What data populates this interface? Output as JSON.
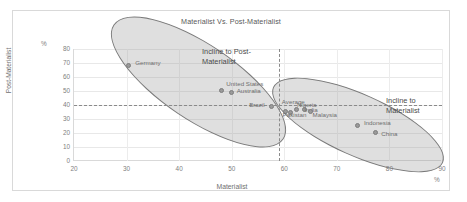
{
  "chart_data": {
    "type": "scatter",
    "title": "Materialist Vs. Post-Materialist",
    "xlabel": "Materialist",
    "ylabel": "Post-Materialist",
    "x_unit": "%",
    "y_unit": "%",
    "xlim": [
      20,
      90
    ],
    "ylim": [
      0,
      80
    ],
    "xticks": [
      20,
      30,
      40,
      50,
      60,
      70,
      80,
      90
    ],
    "yticks": [
      0,
      10,
      20,
      30,
      40,
      50,
      60,
      70,
      80
    ],
    "grid": true,
    "legend": "none",
    "points": [
      {
        "label": "Germany",
        "x": 30.3,
        "y": 68
      },
      {
        "label": "United States",
        "x": 48.0,
        "y": 50.5
      },
      {
        "label": "Australia",
        "x": 50.0,
        "y": 49
      },
      {
        "label": "Brazil",
        "x": 57.5,
        "y": 39
      },
      {
        "label": "Average",
        "x": 60.3,
        "y": 35.5
      },
      {
        "label": "Pakistan",
        "x": 61.2,
        "y": 35
      },
      {
        "label": "Nigeria",
        "x": 62.4,
        "y": 37
      },
      {
        "label": "India",
        "x": 63.8,
        "y": 36.5
      },
      {
        "label": "Malaysia",
        "x": 65.0,
        "y": 35.5
      },
      {
        "label": "Indonesia",
        "x": 74.0,
        "y": 25.5
      },
      {
        "label": "China",
        "x": 77.3,
        "y": 20.5
      }
    ],
    "reference_lines": [
      {
        "name": "average-postmaterialist",
        "orientation": "horizontal",
        "value": 40,
        "style": "dashed"
      },
      {
        "name": "average-materialist",
        "orientation": "vertical",
        "value": 59,
        "style": "dashed"
      }
    ],
    "annotations": [
      {
        "name": "incline-post-materialist",
        "text": "Incline to Post-\nMaterialist"
      },
      {
        "name": "incline-materialist",
        "text": "Incline to\nMaterialist"
      }
    ],
    "groupings": [
      {
        "name": "post-materialist-cluster",
        "shape": "ellipse"
      },
      {
        "name": "materialist-cluster",
        "shape": "ellipse"
      }
    ],
    "colors": {
      "marker": "#9a9a9a",
      "ellipse_fill": "rgba(150,150,150,0.30)",
      "ellipse_stroke": "#7a7a7a",
      "grid": "#e8e8e8",
      "text": "#595959"
    }
  }
}
